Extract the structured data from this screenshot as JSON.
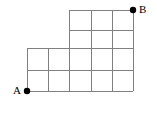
{
  "figure": {
    "kind": "lattice-grid-path-diagram",
    "background_color": "#ffffff",
    "line_color": "#808080",
    "line_width": 1,
    "point_color": "#000000",
    "point_radius": 3.2,
    "label_color": "#000000",
    "width": 157,
    "height": 115
  },
  "labels": {
    "start": "A",
    "end": "B"
  },
  "points": [
    {
      "name": "A",
      "label": "A",
      "x": 27,
      "y": 91
    },
    {
      "name": "B",
      "label": "B",
      "x": 133,
      "y": 10
    }
  ],
  "geometry": {
    "x_ticks": [
      27,
      48,
      69,
      91,
      112,
      133
    ],
    "y_ticks": [
      10,
      30,
      48,
      70,
      91
    ],
    "cell_width": 21.2,
    "cell_height": 20.25,
    "lower_region": {
      "x_start": 27,
      "x_end": 133,
      "y_start": 48,
      "y_end": 91,
      "columns": 5,
      "rows": 2
    },
    "upper_region": {
      "x_start": 69,
      "x_end": 133,
      "y_start": 10,
      "y_end": 48,
      "columns": 3,
      "rows": 2
    }
  },
  "horizontal_lines": [
    {
      "name": "h-top",
      "x1": 69,
      "x2": 133,
      "y": 10
    },
    {
      "name": "h-second",
      "x1": 69,
      "x2": 133,
      "y": 30
    },
    {
      "name": "h-middle",
      "x1": 27,
      "x2": 133,
      "y": 48
    },
    {
      "name": "h-fourth",
      "x1": 27,
      "x2": 133,
      "y": 70
    },
    {
      "name": "h-bottom",
      "x1": 27,
      "x2": 133,
      "y": 91
    }
  ],
  "vertical_lines": [
    {
      "name": "v-1",
      "x": 27,
      "y1": 48,
      "y2": 91
    },
    {
      "name": "v-2",
      "x": 48,
      "y1": 48,
      "y2": 91
    },
    {
      "name": "v-3",
      "x": 69,
      "y1": 10,
      "y2": 91
    },
    {
      "name": "v-4",
      "x": 91,
      "y1": 10,
      "y2": 91
    },
    {
      "name": "v-5",
      "x": 112,
      "y1": 10,
      "y2": 91
    },
    {
      "name": "v-6",
      "x": 133,
      "y1": 10,
      "y2": 91
    }
  ]
}
